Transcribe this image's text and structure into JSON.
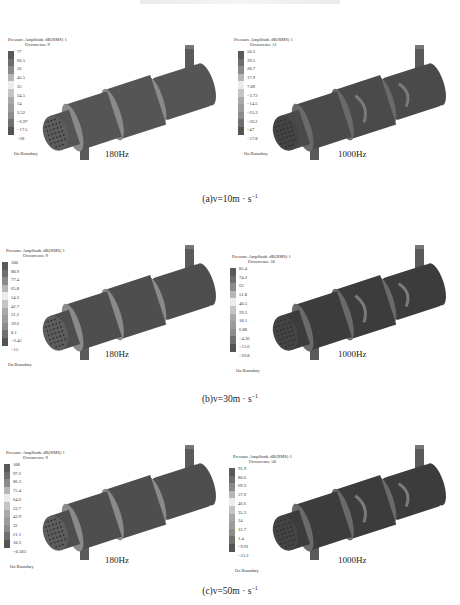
{
  "figure": {
    "rows": [
      {
        "caption_prefix": "(a)v=10m · s",
        "caption_sup": "−1",
        "panels": [
          {
            "freq_label": "180Hz",
            "legend_title": "Pressure Amplitude dB(RMS) 1",
            "legend_subtitle": "Occurrence 9",
            "ticks": [
              "77",
              "66.5",
              "56",
              "45.5",
              "35",
              "24.5",
              "14",
              "3.52",
              "−6.97",
              "−17.5",
              "−28"
            ],
            "boundary_label": "On Boundary"
          },
          {
            "freq_label": "1000Hz",
            "legend_title": "Pressure Amplitude dB(RMS) 1",
            "legend_subtitle": "Occurrence 51",
            "ticks": [
              "50.3",
              "39.5",
              "28.7",
              "17.9",
              "7.09",
              "−3.72",
              "−14.5",
              "−25.3",
              "−36.2",
              "−47",
              "−57.8"
            ],
            "boundary_label": "On Boundary"
          }
        ]
      },
      {
        "caption_prefix": "(b)v=30m · s",
        "caption_sup": "−1",
        "panels": [
          {
            "freq_label": "180Hz",
            "legend_title": "Pressure Amplitude dB(RMS) 1",
            "legend_subtitle": "Occurrence 9",
            "ticks": [
              "100",
              "88.9",
              "77.4",
              "65.8",
              "54.3",
              "42.7",
              "31.2",
              "19.6",
              "8.1",
              "−3.45",
              "−15"
            ],
            "boundary_label": "On Boundary"
          },
          {
            "freq_label": "1000Hz",
            "legend_title": "Pressure Amplitude dB(RMS) 1",
            "legend_subtitle": "Occurrence 50",
            "ticks": [
              "85.4",
              "74.2",
              "63",
              "51.8",
              "40.5",
              "29.3",
              "18.1",
              "6.88",
              "−4.36",
              "−15.6",
              "−26.8"
            ],
            "boundary_label": "On Boundary"
          }
        ]
      },
      {
        "caption_prefix": "(c)v=50m · s",
        "caption_sup": "−1",
        "panels": [
          {
            "freq_label": "180Hz",
            "legend_title": "Pressure Amplitude dB(RMS) 1",
            "legend_subtitle": "Occurrence 9",
            "ticks": [
              "108",
              "97.2",
              "86.3",
              "75.4",
              "64.6",
              "53.7",
              "42.9",
              "32",
              "21.1",
              "10.3",
              "−0.583"
            ],
            "boundary_label": "On Boundary"
          },
          {
            "freq_label": "1000Hz",
            "legend_title": "Pressure Amplitude dB(RMS) 1",
            "legend_subtitle": "Occurrence 50",
            "ticks": [
              "91.9",
              "80.6",
              "69.3",
              "57.9",
              "46.6",
              "35.3",
              "24",
              "12.7",
              "1.4",
              "−9.91",
              "−21.2"
            ],
            "boundary_label": "On Boundary"
          }
        ]
      }
    ],
    "colormap": [
      "#5a5a5a",
      "#6e6e6e",
      "#8a8a8a",
      "#b6b6b6",
      "#ececec",
      "#c4c4c4",
      "#a9a9a9",
      "#9c9c9c",
      "#8c8c8c",
      "#707070",
      "#545454"
    ]
  }
}
